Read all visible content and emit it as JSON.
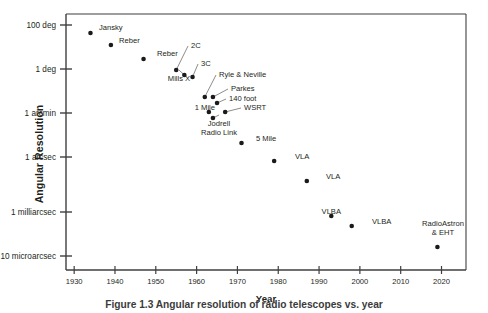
{
  "chart_data": {
    "type": "scatter",
    "title": "",
    "xlabel": "Year",
    "ylabel": "Angular Resolution",
    "xlim": [
      1928,
      2026
    ],
    "xticks": [
      "1930",
      "1940",
      "1950",
      "1960",
      "1970",
      "1980",
      "1990",
      "2000",
      "2010",
      "2020"
    ],
    "xtick_values": [
      1930,
      1940,
      1950,
      1960,
      1970,
      1980,
      1990,
      2000,
      2010,
      2020
    ],
    "ytick_labels": [
      "100 deg",
      "1 deg",
      "1 arcmin",
      "1 arcsec",
      "1 milliarcsec",
      "10 microarcsec"
    ],
    "ytick_positions": [
      25,
      69,
      113,
      157,
      212,
      256
    ],
    "grid": false,
    "legend": false,
    "points": [
      {
        "label": "Jansky",
        "x": 1934,
        "y": 33,
        "lx": 99,
        "ly": 28,
        "align": "l",
        "leader": false
      },
      {
        "label": "Reber",
        "x": 1939,
        "y": 45,
        "lx": 119,
        "ly": 41,
        "align": "l",
        "leader": false
      },
      {
        "label": "Reber",
        "x": 1947,
        "y": 59,
        "lx": 157,
        "ly": 54,
        "align": "l",
        "leader": false
      },
      {
        "label": "2C",
        "x": 1955,
        "y": 70,
        "lx": 191,
        "ly": 46,
        "align": "l",
        "leader": true
      },
      {
        "label": "Mills X",
        "x": 1957,
        "y": 75,
        "lx": 179,
        "ly": 79,
        "align": "c",
        "leader": true
      },
      {
        "label": "3C",
        "x": 1959,
        "y": 77,
        "lx": 201,
        "ly": 64,
        "align": "l",
        "leader": true
      },
      {
        "label": "Ryle & Neville",
        "x": 1962,
        "y": 97,
        "lx": 219,
        "ly": 75,
        "align": "l",
        "leader": true
      },
      {
        "label": "Parkes",
        "x": 1964,
        "y": 97,
        "lx": 231,
        "ly": 89,
        "align": "l",
        "leader": true
      },
      {
        "label": "140 foot",
        "x": 1965,
        "y": 103,
        "lx": 229,
        "ly": 99,
        "align": "l",
        "leader": true
      },
      {
        "label": "WSRT",
        "x": 1967,
        "y": 112,
        "lx": 244,
        "ly": 108,
        "align": "l",
        "leader": true
      },
      {
        "label": "1 Mile",
        "x": 1963,
        "y": 112,
        "lx": 215,
        "ly": 108,
        "align": "r",
        "leader": false
      },
      {
        "label": "Jodrell\nRadio Link",
        "x": 1964,
        "y": 118,
        "lx": 219,
        "ly": 124,
        "align": "c",
        "leader": true
      },
      {
        "label": "5 Mile",
        "x": 1971,
        "y": 143,
        "lx": 256,
        "ly": 139,
        "align": "l",
        "leader": false
      },
      {
        "label": "VLA",
        "x": 1979,
        "y": 161,
        "lx": 295,
        "ly": 157,
        "align": "l",
        "leader": false
      },
      {
        "label": "VLA",
        "x": 1987,
        "y": 181,
        "lx": 326,
        "ly": 177,
        "align": "l",
        "leader": false
      },
      {
        "label": "VLBA",
        "x": 1993,
        "y": 216,
        "lx": 341,
        "ly": 212,
        "align": "r",
        "leader": false
      },
      {
        "label": "VLBA",
        "x": 1998,
        "y": 226,
        "lx": 372,
        "ly": 222,
        "align": "l",
        "leader": false
      },
      {
        "label": "RadioAstron\n& EHT",
        "x": 2019,
        "y": 247,
        "lx": 443,
        "ly": 224,
        "align": "c",
        "leader": false
      }
    ]
  },
  "axes": {
    "x_axis_title": "Year",
    "y_axis_title": "Angular Resolution"
  },
  "caption": {
    "text": "Figure 1.3  Angular resolution of radio telescopes vs. year"
  },
  "colors": {
    "axis": "#3f3f3f",
    "point": "#1a1a1a",
    "text": "#231f20",
    "background": "#ffffff"
  }
}
